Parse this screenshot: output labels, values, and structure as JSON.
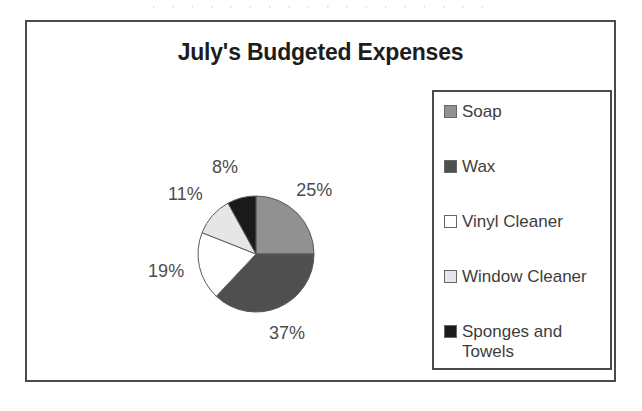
{
  "page": {
    "scan_artifact_text": "· ·  · · ·   ·  · ·   ·  ·   · ·  ·  · · ·   ·  ·"
  },
  "chart_frame": {
    "title": "July's Budgeted Expenses"
  },
  "legend": {
    "position": "right",
    "items": [
      {
        "label": "Soap",
        "swatch_color": "#919191",
        "swatch_name": "legend-swatch-soap"
      },
      {
        "label": "Wax",
        "swatch_color": "#4f4f4f",
        "swatch_name": "legend-swatch-wax"
      },
      {
        "label": "Vinyl Cleaner",
        "swatch_color": "#ffffff",
        "swatch_name": "legend-swatch-vinyl-cleaner"
      },
      {
        "label": "Window Cleaner",
        "swatch_color": "#e6e6e6",
        "swatch_name": "legend-swatch-window-cleaner"
      },
      {
        "label": "Sponges and\nTowels",
        "swatch_color": "#1a1a1a",
        "swatch_name": "legend-swatch-sponges-and-towels"
      }
    ]
  },
  "chart_data": {
    "type": "pie",
    "title": "July's Budgeted Expenses",
    "xlabel": "",
    "ylabel": "",
    "legend_position": "right",
    "start_angle_deg": 0,
    "direction": "clockwise",
    "categories": [
      "Soap",
      "Wax",
      "Vinyl Cleaner",
      "Window Cleaner",
      "Sponges and Towels"
    ],
    "values": [
      25,
      37,
      19,
      11,
      8
    ],
    "value_unit": "%",
    "data_labels": [
      "25%",
      "37%",
      "19%",
      "11%",
      "8%"
    ],
    "colors": [
      "#919191",
      "#4f4f4f",
      "#ffffff",
      "#e6e6e6",
      "#1a1a1a"
    ],
    "slices": [
      {
        "name": "Soap",
        "value": 25,
        "label": "25%",
        "color": "#919191"
      },
      {
        "name": "Wax",
        "value": 37,
        "label": "37%",
        "color": "#4f4f4f"
      },
      {
        "name": "Vinyl Cleaner",
        "value": 19,
        "label": "19%",
        "color": "#ffffff"
      },
      {
        "name": "Window Cleaner",
        "value": 11,
        "label": "11%",
        "color": "#e6e6e6"
      },
      {
        "name": "Sponges and Towels",
        "value": 8,
        "label": "8%",
        "color": "#1a1a1a"
      }
    ]
  }
}
